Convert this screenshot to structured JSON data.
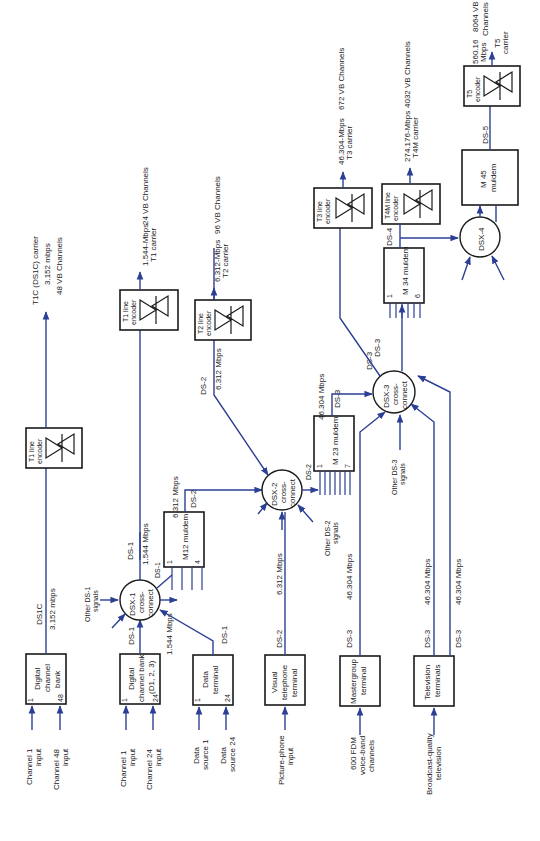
{
  "diagram": {
    "orientation": "rotated-90-ccw",
    "colors": {
      "line": "#2b3f94",
      "box": "#1a1a1a",
      "background": "#ffffff"
    },
    "sources": {
      "digital_channel_bank_48": {
        "label1": "Digital",
        "label2": "channel",
        "label3": "bank",
        "pin_first": "1",
        "pin_last": "48",
        "in1": "Channel 1",
        "in1b": "input",
        "in2": "Channel 48",
        "in2b": "input"
      },
      "digital_channel_bank_24": {
        "label1": "Digital",
        "label2": "channel bank",
        "label3": "(D1, 2, 3)",
        "pin_first": "1",
        "pin_last": "24",
        "in1": "Channel 1",
        "in1b": "input",
        "in2": "Channel 24",
        "in2b": "input"
      },
      "data_terminal": {
        "label1": "Data",
        "label2": "terminal",
        "pin_first": "1",
        "pin_last": "24",
        "in1": "Data",
        "in1b": "source 1",
        "in2": "Data",
        "in2b": "source 24"
      },
      "visual_telephone": {
        "label1": "Visual",
        "label2": "telephone",
        "label3": "terminal",
        "in1": "Picture-phone",
        "in1b": "input"
      },
      "mastergroup": {
        "label1": "Mastergroup",
        "label2": "terminal",
        "in1": "600 FDM",
        "in1b": "voice-band",
        "in1c": "channels"
      },
      "television": {
        "label1": "Television",
        "label2": "terminals",
        "in1": "Broadcast-quality",
        "in1b": "television"
      }
    },
    "cross_connects": {
      "dsx1": {
        "l1": "DSX-1",
        "l2": "cross-",
        "l3": "connect",
        "other1": "Other DS-1",
        "other2": "signals"
      },
      "dsx2": {
        "l1": "DSX-2",
        "l2": "cross-",
        "l3": "connect",
        "other1": "Other DS-2",
        "other2": "signals"
      },
      "dsx3": {
        "l1": "DSX-3",
        "l2": "cross-",
        "l3": "connect",
        "other1": "Other DS-3",
        "other2": "signals"
      },
      "dsx4": {
        "l1": "DSX-4"
      }
    },
    "muldems": {
      "m12": {
        "label": "M12 muldem",
        "pin_first": "1",
        "pin_last": "4"
      },
      "m23": {
        "label": "M 23 muldem",
        "pin_first": "1",
        "pin_last": "7"
      },
      "m34": {
        "label": "M 34 muldem",
        "pin_first": "1",
        "pin_last": "6"
      },
      "m45": {
        "l1": "M 45",
        "l2": "muldem"
      }
    },
    "encoders": {
      "t1c": {
        "l1": "T1 line",
        "l2": "encoder",
        "out1": "T1C (DS1C) carrier",
        "out2": "3.152 mbps",
        "out3": "48 VB Channels"
      },
      "t1": {
        "l1": "T1 line",
        "l2": "encoder",
        "out1": "1.544-Mbps",
        "out2": "T1 carrier",
        "out3": "24 VB Channels"
      },
      "t2": {
        "l1": "T2 line",
        "l2": "encoder",
        "out1": "6.312-Mbps",
        "out2": "T2 carrier",
        "out3": "96 VB Channels"
      },
      "t3": {
        "l1": "T3 line",
        "l2": "encoder",
        "out1": "46.304-Mbps",
        "out2": "T3 carrier",
        "out3": "672 VB Channels"
      },
      "t4m": {
        "l1": "T4M line",
        "l2": "encoder",
        "out1": "274.176-Mbps",
        "out2": "T4M carrier",
        "out3": "4032 VB Channels"
      },
      "t5": {
        "l1": "T5",
        "l2": "encoder",
        "out1": "560.16",
        "out2": "Mbps",
        "out3": "T5",
        "out4": "carrier",
        "out5": "8064 VB",
        "out6": "Channels"
      }
    },
    "link_labels": {
      "ds1c": "DS1C",
      "rate_3152": "3.152 mbps",
      "ds1_a": "DS-1",
      "ds1_b": "DS-1",
      "ds1_c": "DS-1",
      "ds1_d": "DS-1",
      "rate_1544_a": "1.544 Mbps",
      "rate_1544_b": "1.544 Mbps",
      "ds2_a": "DS-2",
      "ds2_b": "DS-2",
      "ds2_c": "DS-2",
      "ds2_d": "DS-2",
      "rate_6312_a": "6.312 Mbps",
      "rate_6312_b": "6.312 Mbps",
      "rate_6312_c": "6.312 Mbps",
      "ds3_a": "DS-3",
      "ds3_b": "DS-3",
      "ds3_c": "DS-3",
      "ds3_d": "DS-3",
      "ds3_e": "DS-3",
      "rate_46304_a": "46.304 Mbps",
      "rate_46304_b": "46.304 Mbps",
      "rate_46304_c": "46.304 Mbps",
      "rate_46304_d": "46.304 Mbps",
      "ds4": "DS-4",
      "ds5": "DS-5"
    }
  }
}
